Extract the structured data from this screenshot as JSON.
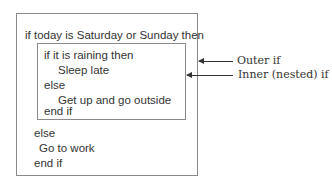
{
  "diagram": {
    "outer": {
      "header": "if today is Saturday or Sunday then",
      "else": "else",
      "else_body": "Go to work",
      "end": "end if"
    },
    "inner": {
      "header": "if it is raining then",
      "then_body": "Sleep late",
      "else": "else",
      "else_body": "Get up and go outside",
      "end": "end if"
    },
    "annotations": {
      "outer_label": "Outer if",
      "inner_label": "Inner (nested) if"
    }
  }
}
